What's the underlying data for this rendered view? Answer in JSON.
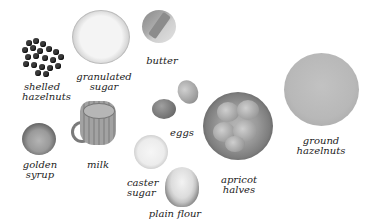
{
  "image": {
    "type": "cookbook ingredients photo",
    "palette": {
      "background": "#ffffff",
      "text": "#222222",
      "tone": "grayscale"
    }
  },
  "ingredients": [
    {
      "id": "shelled-hazelnuts",
      "label_lines": [
        "shelled",
        "hazelnuts"
      ]
    },
    {
      "id": "granulated-sugar",
      "label_lines": [
        "granulated",
        "sugar"
      ]
    },
    {
      "id": "butter",
      "label_lines": [
        "butter"
      ]
    },
    {
      "id": "eggs",
      "label_lines": [
        "eggs"
      ]
    },
    {
      "id": "apricot-halves",
      "label_lines": [
        "apricot",
        "halves"
      ]
    },
    {
      "id": "ground-hazelnuts",
      "label_lines": [
        "ground",
        "hazelnuts"
      ]
    },
    {
      "id": "golden-syrup",
      "label_lines": [
        "golden",
        "syrup"
      ]
    },
    {
      "id": "milk",
      "label_lines": [
        "milk"
      ]
    },
    {
      "id": "caster-sugar",
      "label_lines": [
        "caster",
        "sugar"
      ]
    },
    {
      "id": "plain-flour",
      "label_lines": [
        "plain flour"
      ]
    }
  ]
}
